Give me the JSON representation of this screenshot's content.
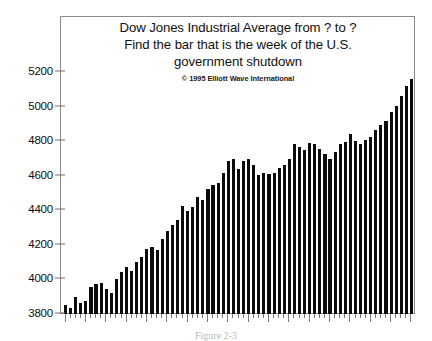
{
  "chart_data": {
    "type": "bar",
    "title": "Dow Jones Industrial Average from ? to ?",
    "title_lines": [
      "Dow Jones Industrial Average from ? to ?",
      "Find the bar that is the week of the U.S.",
      "government shutdown"
    ],
    "copyright": "© 1995 Elliott Wave International",
    "caption": "Figure 2-3",
    "xlabel": "",
    "ylabel": "",
    "ylim": [
      3800,
      5240
    ],
    "ytick_labels": [
      "3800",
      "4000",
      "4200",
      "4400",
      "4600",
      "4800",
      "5000",
      "5200"
    ],
    "yticks": [
      3800,
      4000,
      4200,
      4400,
      4600,
      4800,
      5000,
      5200
    ],
    "grid": false,
    "legend": null,
    "bar_color": "#0b0b0b",
    "axis_color": "#8a8a8a",
    "categories": [
      "w1",
      "w2",
      "w3",
      "w4",
      "w5",
      "w6",
      "w7",
      "w8",
      "w9",
      "w10",
      "w11",
      "w12",
      "w13",
      "w14",
      "w15",
      "w16",
      "w17",
      "w18",
      "w19",
      "w20",
      "w21",
      "w22",
      "w23",
      "w24",
      "w25",
      "w26",
      "w27",
      "w28",
      "w29",
      "w30",
      "w31",
      "w32",
      "w33",
      "w34",
      "w35",
      "w36",
      "w37",
      "w38",
      "w39",
      "w40",
      "w41",
      "w42",
      "w43",
      "w44",
      "w45",
      "w46",
      "w47",
      "w48",
      "w49",
      "w50",
      "w51",
      "w52",
      "w53",
      "w54",
      "w55",
      "w56",
      "w57",
      "w58",
      "w59",
      "w60",
      "w61",
      "w62",
      "w63",
      "w64",
      "w65",
      "w66",
      "w67",
      "w68",
      "w69"
    ],
    "values": [
      3856,
      3840,
      3905,
      3872,
      3882,
      3960,
      3980,
      3985,
      3950,
      3930,
      4010,
      4050,
      4080,
      4055,
      4105,
      4135,
      4180,
      4195,
      4175,
      4240,
      4285,
      4320,
      4350,
      4430,
      4400,
      4425,
      4480,
      4465,
      4530,
      4550,
      4565,
      4620,
      4690,
      4700,
      4645,
      4690,
      4700,
      4665,
      4610,
      4620,
      4615,
      4620,
      4650,
      4670,
      4700,
      4790,
      4770,
      4755,
      4795,
      4790,
      4760,
      4730,
      4705,
      4745,
      4790,
      4800,
      4845,
      4805,
      4790,
      4810,
      4830,
      4870,
      4900,
      4925,
      4975,
      5010,
      5065,
      5125,
      5165
    ]
  },
  "axis": {
    "y_tick_positions_px": [
      313,
      278,
      244,
      209,
      175,
      141,
      106,
      71
    ]
  }
}
